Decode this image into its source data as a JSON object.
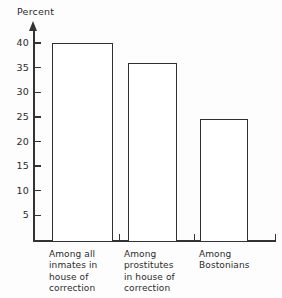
{
  "chart_data": {
    "type": "bar",
    "title": "",
    "xlabel": "",
    "ylabel": "Percent",
    "ylim": [
      0,
      42
    ],
    "grid": false,
    "legend": "none",
    "orientation": "vertical",
    "categories": [
      "Among all inmates in house of correction",
      "Among prostitutes in house of correction",
      "Among Bostonians"
    ],
    "category_lines": [
      "Among all\ninmates in\nhouse of\ncorrection",
      "Among\nprostitutes\nin house of\ncorrection",
      "Among\nBostonians"
    ],
    "values": [
      40,
      36,
      24.5
    ],
    "y_ticks": [
      40,
      35,
      30,
      25,
      20,
      15,
      10,
      5
    ],
    "y_tick_labels": [
      "40",
      "35",
      "30",
      "25",
      "20",
      "15",
      "10",
      "5"
    ],
    "bar_style": {
      "fill": "#ffffff",
      "edge": "#2f2f2f"
    },
    "axis_color": "#333333"
  }
}
